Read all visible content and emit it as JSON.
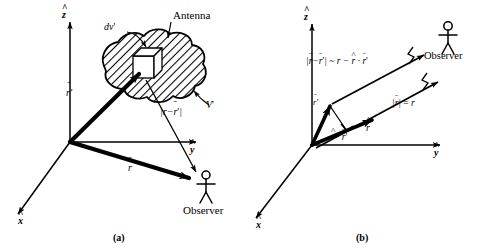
{
  "figure": {
    "panels": [
      {
        "id": "a",
        "caption": "(a)",
        "axes": {
          "z": "z",
          "y": "y",
          "x": "x"
        },
        "labels": {
          "antenna": "Antenna",
          "dv": "dv'",
          "volume": "V'",
          "r_source": "r'",
          "r_obs": "r",
          "distance": "|r - r'|",
          "observer": "Observer"
        }
      },
      {
        "id": "b",
        "caption": "(b)",
        "axes": {
          "z": "z",
          "y": "y",
          "x": "x"
        },
        "labels": {
          "approx": "|r - r'| ~ r - r · r'",
          "approx_parts": {
            "lhs_open": "|",
            "lhs_r": "r",
            "minus": "−",
            "lhs_rp": "r'",
            "lhs_close": "|",
            "approx_sign": "~",
            "rhs_r": "r",
            "rhs_minus": "−",
            "rhs_rhat": "r",
            "dot": "·",
            "rhs_rp": "r'"
          },
          "magnitude": "|r| = r",
          "r_source": "r'",
          "r_hat": "r",
          "projection": "r · r'",
          "observer": "Observer"
        }
      }
    ],
    "colors": {
      "ink": "#000000",
      "background": "#ffffff"
    }
  }
}
